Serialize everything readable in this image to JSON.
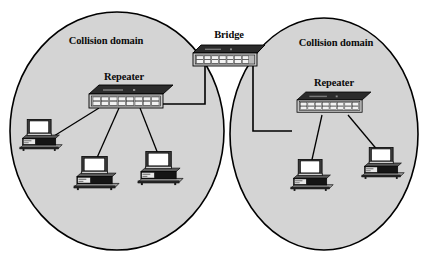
{
  "diagram": {
    "type": "network-topology",
    "colors": {
      "domain_fill": "#d4d4d4",
      "domain_stroke": "#000000",
      "device_top": "#2b2b2b",
      "device_face": "#c9c9c9",
      "device_stroke": "#000000",
      "cable": "#000000",
      "monitor_screen": "#ffffff",
      "case_dark": "#1a1a1a",
      "background": "#ffffff"
    },
    "domains": [
      {
        "id": "left",
        "label": "Collision domain"
      },
      {
        "id": "right",
        "label": "Collision domain"
      }
    ],
    "devices": [
      {
        "id": "bridge",
        "label": "Bridge",
        "kind": "bridge"
      },
      {
        "id": "repeater-left",
        "label": "Repeater",
        "kind": "repeater",
        "ports": 16
      },
      {
        "id": "repeater-right",
        "label": "Repeater",
        "kind": "repeater",
        "ports": 16
      }
    ],
    "workstations": [
      {
        "id": "ws-left-1",
        "domain": "left",
        "label": ""
      },
      {
        "id": "ws-left-2",
        "domain": "left",
        "label": ""
      },
      {
        "id": "ws-left-3",
        "domain": "left",
        "label": ""
      },
      {
        "id": "ws-right-1",
        "domain": "right",
        "label": ""
      },
      {
        "id": "ws-right-2",
        "domain": "right",
        "label": ""
      }
    ],
    "links": [
      {
        "from": "bridge",
        "to": "repeater-left"
      },
      {
        "from": "bridge",
        "to": "repeater-right"
      },
      {
        "from": "repeater-left",
        "to": "ws-left-1"
      },
      {
        "from": "repeater-left",
        "to": "ws-left-2"
      },
      {
        "from": "repeater-left",
        "to": "ws-left-3"
      },
      {
        "from": "repeater-right",
        "to": "ws-right-1"
      },
      {
        "from": "repeater-right",
        "to": "ws-right-2"
      }
    ]
  }
}
